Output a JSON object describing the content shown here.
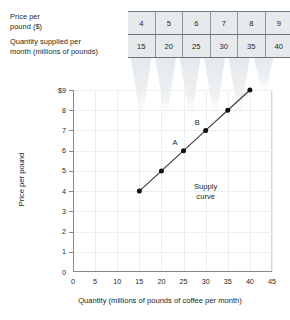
{
  "schedule": {
    "price_label": "Price per\npound ($)",
    "price_label_line1": "Price per",
    "price_label_line2": "pound ($)",
    "quantity_label_line1": "Quantity supplied per",
    "quantity_label_line2": "month (millions of pounds)",
    "prices": [
      "4",
      "5",
      "6",
      "7",
      "8",
      "9"
    ],
    "quantities": [
      "15",
      "20",
      "25",
      "30",
      "35",
      "40"
    ]
  },
  "chart_data": {
    "type": "line",
    "title": "",
    "xlabel": "Quantity (millions of pounds of coffee per month)",
    "ylabel": "Price per pound",
    "xlim": [
      0,
      45
    ],
    "ylim": [
      0,
      9
    ],
    "xticks": [
      "0",
      "5",
      "10",
      "15",
      "20",
      "25",
      "30",
      "35",
      "40",
      "45"
    ],
    "yticks": [
      "0",
      "1",
      "2",
      "3",
      "4",
      "5",
      "6",
      "7",
      "8",
      "$9"
    ],
    "grid": true,
    "legend": "none",
    "series": [
      {
        "name": "Supply curve",
        "x": [
          15,
          20,
          25,
          30,
          35,
          40
        ],
        "y": [
          4,
          5,
          6,
          7,
          8,
          9
        ]
      }
    ],
    "annotations": [
      {
        "text": "A",
        "x": 25,
        "y": 6
      },
      {
        "text": "B",
        "x": 30,
        "y": 7
      },
      {
        "text": "Supply curve",
        "x": 30,
        "y": 4
      }
    ],
    "curve_caption_line1": "Supply",
    "curve_caption_line2": "curve",
    "point_a_label": "A",
    "point_b_label": "B",
    "colors": {
      "curve": "#3d3d3d",
      "point": "#111111",
      "grid": "#eceef0",
      "axis": "#808a91",
      "table_fill": "#e6eaed",
      "table_border": "#6e7579",
      "funnel": "#e9edf0"
    }
  }
}
